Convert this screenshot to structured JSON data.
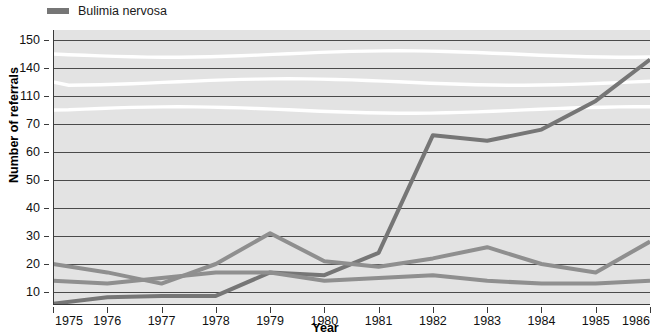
{
  "legend": {
    "items": [
      {
        "label": "Bulimia nervosa",
        "color": "#767676",
        "icon": "line-swatch"
      }
    ]
  },
  "axes": {
    "y_title": "Number of referrals",
    "x_title": "Year",
    "y_ticks": [
      150,
      140,
      110,
      70,
      60,
      50,
      40,
      30,
      20,
      10
    ],
    "x_ticks": [
      "1975",
      "1976",
      "1977",
      "1978",
      "1979",
      "1980",
      "1981",
      "1982",
      "1983",
      "1984",
      "1985",
      "1986"
    ],
    "axis_breaks": [
      {
        "between": [
          150,
          140
        ]
      },
      {
        "between": [
          140,
          110
        ]
      },
      {
        "between": [
          110,
          70
        ]
      }
    ]
  },
  "style": {
    "plot_background": "#e3e3e3",
    "gridline_color": "#4a4a4a",
    "break_color": "#ffffff"
  },
  "chart_data": {
    "type": "line",
    "title": "",
    "xlabel": "Year",
    "ylabel": "Number of referrals",
    "x": [
      1975,
      1976,
      1977,
      1978,
      1979,
      1980,
      1981,
      1982,
      1983,
      1984,
      1985,
      1986
    ],
    "ylim": [
      0,
      150
    ],
    "grid": true,
    "legend_position": "top-left",
    "y_tick_values": [
      150,
      140,
      110,
      70,
      60,
      50,
      40,
      30,
      20,
      10
    ],
    "broken_axis": true,
    "series": [
      {
        "name": "Bulimia nervosa",
        "color": "#767676",
        "width": 4,
        "values": [
          1,
          6,
          7,
          7,
          17,
          16,
          24,
          66,
          64,
          68,
          103,
          143
        ]
      },
      {
        "name": "series-2",
        "color": "#8f8f8f",
        "width": 4,
        "values": [
          20,
          17,
          13,
          20,
          31,
          21,
          19,
          22,
          26,
          20,
          17,
          28
        ]
      },
      {
        "name": "series-3",
        "color": "#8f8f8f",
        "width": 4,
        "values": [
          14,
          13,
          15,
          17,
          17,
          14,
          15,
          16,
          14,
          13,
          13,
          14
        ]
      }
    ]
  }
}
